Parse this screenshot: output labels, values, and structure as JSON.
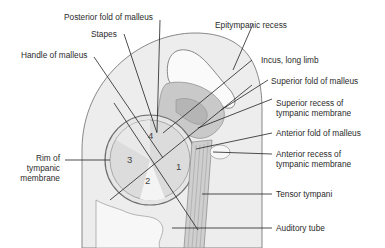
{
  "figure": {
    "colors": {
      "background": "#ffffff",
      "wall": "#ededed",
      "drum": "#dcdcdc",
      "drum_highlight": "#f2f2f2",
      "ossicle": "#c6c6c6",
      "line": "#222222"
    },
    "labels": [
      {
        "id": "posterior-fold-of-malleus",
        "lines": [
          "Posterior fold of malleus"
        ]
      },
      {
        "id": "stapes",
        "lines": [
          "Stapes"
        ]
      },
      {
        "id": "handle-of-malleus",
        "lines": [
          "Handle of malleus"
        ]
      },
      {
        "id": "epitympanic-recess",
        "lines": [
          "Epitympanic recess"
        ]
      },
      {
        "id": "incus-long-limb",
        "lines": [
          "Incus, long limb"
        ]
      },
      {
        "id": "superior-fold-of-malleus",
        "lines": [
          "Superior fold of malleus"
        ]
      },
      {
        "id": "superior-recess",
        "lines": [
          "Superior recess of",
          "tympanic membrane"
        ]
      },
      {
        "id": "anterior-fold-of-malleus",
        "lines": [
          "Anterior fold of malleus"
        ]
      },
      {
        "id": "anterior-recess",
        "lines": [
          "Anterior recess of",
          "tympanic membrane"
        ]
      },
      {
        "id": "tensor-tympani",
        "lines": [
          "Tensor tympani"
        ]
      },
      {
        "id": "auditory-tube",
        "lines": [
          "Auditory tube"
        ]
      },
      {
        "id": "rim-of-tympanic-membrane",
        "lines": [
          "Rim of",
          "tympanic",
          "membrane"
        ]
      }
    ],
    "quadrants": [
      "1",
      "2",
      "3",
      "4"
    ]
  }
}
